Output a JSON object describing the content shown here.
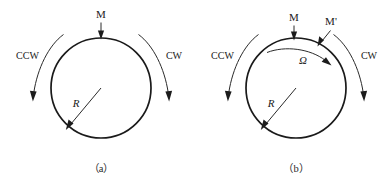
{
  "figure": {
    "type": "technical-diagram",
    "background_color": "#ffffff",
    "line_color": "#1a1a1a",
    "panels": [
      {
        "id": "panel-a",
        "caption": "（a）",
        "circle": {
          "cx": 101,
          "cy": 88,
          "r": 50
        },
        "labels": {
          "moment": "M",
          "ccw": "CCW",
          "cw": "CW",
          "radius": "R"
        },
        "annotations": [
          {
            "name": "moment-arrow",
            "label": "M",
            "direction": "downward onto circle top"
          },
          {
            "name": "ccw-arc-arrow",
            "label": "CCW",
            "direction": "counterclockwise, left side"
          },
          {
            "name": "cw-arc-arrow",
            "label": "CW",
            "direction": "clockwise, right side"
          },
          {
            "name": "radius-arrow",
            "label": "R",
            "direction": "from center to lower-left rim"
          }
        ]
      },
      {
        "id": "panel-b",
        "caption": "（b）",
        "circle": {
          "cx": 296,
          "cy": 88,
          "r": 50
        },
        "labels": {
          "moment": "M",
          "moment_prime": "M'",
          "ccw": "CCW",
          "cw": "CW",
          "radius": "R",
          "omega": "Ω"
        },
        "annotations": [
          {
            "name": "moment-arrow",
            "label": "M",
            "direction": "downward onto circle top"
          },
          {
            "name": "moment-prime-arrow",
            "label": "M'",
            "direction": "diagonal down-left onto upper-right rim"
          },
          {
            "name": "ccw-arc-arrow",
            "label": "CCW",
            "direction": "counterclockwise, left side"
          },
          {
            "name": "cw-arc-arrow",
            "label": "CW",
            "direction": "clockwise, right side"
          },
          {
            "name": "omega-arc-arrow",
            "label": "Ω",
            "direction": "clockwise arc inside circle near top"
          },
          {
            "name": "radius-arrow",
            "label": "R",
            "direction": "from center to lower-left rim"
          }
        ]
      }
    ]
  }
}
